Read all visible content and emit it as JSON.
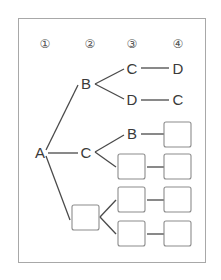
{
  "diagram": {
    "type": "tree",
    "headers": [
      "①",
      "②",
      "③",
      "④"
    ],
    "root": "A",
    "level2": [
      "B",
      "C",
      ""
    ],
    "branches": [
      {
        "level2": "B",
        "level3": "C",
        "level4": "D"
      },
      {
        "level2": "B",
        "level3": "D",
        "level4": "C"
      },
      {
        "level2": "C",
        "level3": "B",
        "level4": ""
      },
      {
        "level2": "C",
        "level3": "",
        "level4": ""
      },
      {
        "level2": "",
        "level3": "",
        "level4": ""
      },
      {
        "level2": "",
        "level3": "",
        "level4": ""
      }
    ],
    "blank_box_note": "empty boxes are fill-in blanks"
  },
  "colors": {
    "line": "#4a4a4a",
    "text": "#3a3a3a",
    "box_border": "#8c8c8c",
    "frame_border": "#a8a8a8"
  }
}
